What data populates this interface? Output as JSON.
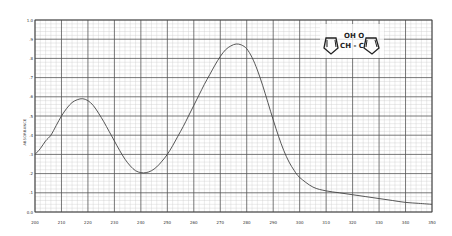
{
  "chart_data": {
    "type": "line",
    "title": "",
    "xlabel": "",
    "ylabel": "ABSORBANCE",
    "xlim": [
      200,
      350
    ],
    "ylim": [
      0.0,
      1.0
    ],
    "grid": true,
    "legend": null,
    "x_ticks": [
      "200",
      "210",
      "220",
      "230",
      "240",
      "250",
      "260",
      "270",
      "280",
      "290",
      "300",
      "310",
      "320",
      "330",
      "340",
      "350"
    ],
    "y_ticks": [
      "0.0",
      ".1",
      ".2",
      ".3",
      ".4",
      ".5",
      ".6",
      ".7",
      ".8",
      ".9",
      "1.0"
    ],
    "series": [
      {
        "name": "UV spectrum",
        "x": [
          200,
          202,
          204,
          206,
          208,
          210,
          212,
          214,
          216,
          218,
          220,
          222,
          224,
          226,
          228,
          230,
          232,
          234,
          236,
          238,
          240,
          242,
          244,
          246,
          248,
          250,
          252,
          254,
          256,
          258,
          260,
          262,
          264,
          266,
          268,
          270,
          272,
          274,
          276,
          278,
          280,
          282,
          284,
          286,
          288,
          290,
          292,
          294,
          296,
          298,
          300,
          305,
          310,
          315,
          320,
          325,
          330,
          335,
          340,
          345,
          350
        ],
        "values": [
          0.3,
          0.33,
          0.37,
          0.4,
          0.45,
          0.5,
          0.54,
          0.57,
          0.585,
          0.59,
          0.58,
          0.555,
          0.515,
          0.47,
          0.42,
          0.37,
          0.32,
          0.275,
          0.24,
          0.215,
          0.205,
          0.205,
          0.215,
          0.235,
          0.265,
          0.3,
          0.345,
          0.395,
          0.445,
          0.5,
          0.555,
          0.61,
          0.665,
          0.715,
          0.765,
          0.81,
          0.845,
          0.865,
          0.875,
          0.87,
          0.85,
          0.805,
          0.74,
          0.66,
          0.57,
          0.48,
          0.395,
          0.32,
          0.26,
          0.215,
          0.18,
          0.13,
          0.11,
          0.1,
          0.09,
          0.08,
          0.07,
          0.06,
          0.05,
          0.045,
          0.04
        ]
      }
    ],
    "annotations": [
      {
        "type": "structure",
        "text": "OH O",
        "label": "furan-CH-C-furan (furoin)",
        "line2": "CH-C"
      }
    ]
  },
  "structure": {
    "top_text": "OH   O",
    "mid_text": "CH - C"
  }
}
